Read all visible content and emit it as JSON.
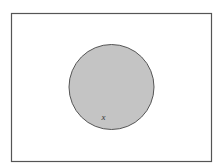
{
  "diagram": {
    "type": "venn",
    "universe": {
      "shape": "rectangle",
      "stroke": "#555555",
      "fill": "#ffffff"
    },
    "sets": [
      {
        "shape": "circle",
        "fill": "#c4c4c4",
        "stroke": "#555555",
        "shaded": true
      }
    ],
    "labels": [
      {
        "text": "x",
        "position": "inside-circle-lower-left"
      }
    ]
  }
}
